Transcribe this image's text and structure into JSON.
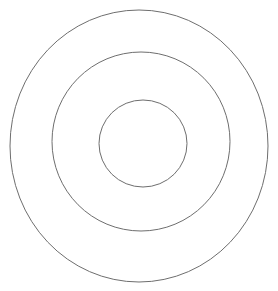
{
  "canvas": {
    "width": 278,
    "height": 291,
    "background_color": "#ffffff"
  },
  "figure": {
    "name": "concentric-circles",
    "shape_count": 3
  },
  "chart_data": {
    "type": "scatter",
    "title": "",
    "subtitle": "",
    "xlabel": "",
    "ylabel": "",
    "grid": false,
    "legend": null,
    "axes_visible": false,
    "tick_labels_x": [],
    "tick_labels_y": [],
    "xlim": [
      0,
      278
    ],
    "ylim": [
      0,
      291
    ],
    "annotations": [],
    "series": [
      {
        "name": "outer-circle",
        "shape": "ellipse",
        "center_x": 139,
        "center_y": 146,
        "radius_x": 129,
        "radius_y": 136,
        "stroke_color": "#6e6e6e",
        "stroke_width": 1,
        "fill": "none"
      },
      {
        "name": "middle-circle",
        "shape": "ellipse",
        "center_x": 141,
        "center_y": 141.5,
        "radius_x": 89,
        "radius_y": 89.5,
        "stroke_color": "#6e6e6e",
        "stroke_width": 1,
        "fill": "none"
      },
      {
        "name": "inner-circle",
        "shape": "ellipse",
        "center_x": 143,
        "center_y": 143.5,
        "radius_x": 44,
        "radius_y": 43.5,
        "stroke_color": "#6e6e6e",
        "stroke_width": 1,
        "fill": "none"
      }
    ]
  }
}
